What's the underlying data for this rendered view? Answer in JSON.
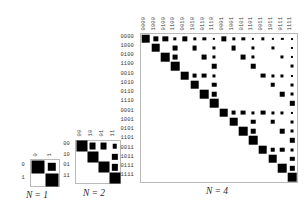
{
  "figure": {
    "background": "#ffffff",
    "marker_color": "#000000",
    "frame_color": "#b9b9b9",
    "label_color": "#3a3a3a"
  },
  "chart_data": {
    "type": "heatmap",
    "title": "",
    "xlabel": "",
    "ylabel": "",
    "grid": false,
    "legend": null,
    "panels": [
      {
        "caption": "N = 1",
        "size": 2,
        "row_labels": [
          "0",
          "1"
        ],
        "col_labels": [
          "0",
          "1"
        ],
        "markers": [
          {
            "row": 0,
            "col": 0,
            "w": 1.0
          },
          {
            "row": 0,
            "col": 1,
            "w": 0.42
          },
          {
            "row": 1,
            "col": 1,
            "w": 1.0
          }
        ]
      },
      {
        "caption": "N = 2",
        "size": 4,
        "row_labels": [
          "00",
          "10",
          "01",
          "11"
        ],
        "col_labels": [
          "00",
          "10",
          "01",
          "11"
        ],
        "markers": [
          {
            "row": 0,
            "col": 0,
            "w": 1.0
          },
          {
            "row": 0,
            "col": 1,
            "w": 0.4
          },
          {
            "row": 0,
            "col": 2,
            "w": 0.4
          },
          {
            "row": 0,
            "col": 3,
            "w": 0.17
          },
          {
            "row": 1,
            "col": 1,
            "w": 1.0
          },
          {
            "row": 1,
            "col": 3,
            "w": 0.33
          },
          {
            "row": 2,
            "col": 2,
            "w": 1.0
          },
          {
            "row": 2,
            "col": 3,
            "w": 0.33
          },
          {
            "row": 3,
            "col": 3,
            "w": 1.0
          }
        ]
      },
      {
        "caption": "N = 4",
        "size": 16,
        "row_labels": [
          "0000",
          "1000",
          "0100",
          "1100",
          "0010",
          "1010",
          "0110",
          "1110",
          "0001",
          "1001",
          "0101",
          "1101",
          "0011",
          "1011",
          "0111",
          "1111"
        ],
        "col_labels": [
          "0000",
          "1000",
          "0100",
          "1100",
          "0010",
          "1010",
          "0110",
          "1110",
          "0001",
          "1001",
          "0101",
          "1101",
          "0011",
          "1011",
          "0111",
          "1111"
        ],
        "markers": [
          {
            "row": 0,
            "col": 0,
            "w": 1.0
          },
          {
            "row": 0,
            "col": 1,
            "w": 0.38
          },
          {
            "row": 0,
            "col": 2,
            "w": 0.38
          },
          {
            "row": 0,
            "col": 3,
            "w": 0.15
          },
          {
            "row": 0,
            "col": 4,
            "w": 0.38
          },
          {
            "row": 0,
            "col": 5,
            "w": 0.15
          },
          {
            "row": 0,
            "col": 6,
            "w": 0.15
          },
          {
            "row": 0,
            "col": 7,
            "w": 0.07
          },
          {
            "row": 0,
            "col": 8,
            "w": 0.38
          },
          {
            "row": 0,
            "col": 9,
            "w": 0.15
          },
          {
            "row": 0,
            "col": 10,
            "w": 0.15
          },
          {
            "row": 0,
            "col": 11,
            "w": 0.07
          },
          {
            "row": 0,
            "col": 12,
            "w": 0.15
          },
          {
            "row": 0,
            "col": 13,
            "w": 0.07
          },
          {
            "row": 0,
            "col": 14,
            "w": 0.07
          },
          {
            "row": 0,
            "col": 15,
            "w": 0.05
          },
          {
            "row": 1,
            "col": 1,
            "w": 1.0
          },
          {
            "row": 1,
            "col": 3,
            "w": 0.32
          },
          {
            "row": 1,
            "col": 5,
            "w": 0.32
          },
          {
            "row": 1,
            "col": 7,
            "w": 0.13
          },
          {
            "row": 1,
            "col": 9,
            "w": 0.32
          },
          {
            "row": 1,
            "col": 11,
            "w": 0.13
          },
          {
            "row": 1,
            "col": 13,
            "w": 0.13
          },
          {
            "row": 1,
            "col": 15,
            "w": 0.06
          },
          {
            "row": 2,
            "col": 2,
            "w": 1.0
          },
          {
            "row": 2,
            "col": 3,
            "w": 0.32
          },
          {
            "row": 2,
            "col": 6,
            "w": 0.32
          },
          {
            "row": 2,
            "col": 7,
            "w": 0.13
          },
          {
            "row": 2,
            "col": 10,
            "w": 0.32
          },
          {
            "row": 2,
            "col": 11,
            "w": 0.13
          },
          {
            "row": 2,
            "col": 14,
            "w": 0.13
          },
          {
            "row": 2,
            "col": 15,
            "w": 0.06
          },
          {
            "row": 3,
            "col": 3,
            "w": 1.0
          },
          {
            "row": 3,
            "col": 7,
            "w": 0.28
          },
          {
            "row": 3,
            "col": 11,
            "w": 0.28
          },
          {
            "row": 3,
            "col": 15,
            "w": 0.12
          },
          {
            "row": 4,
            "col": 4,
            "w": 1.0
          },
          {
            "row": 4,
            "col": 5,
            "w": 0.32
          },
          {
            "row": 4,
            "col": 6,
            "w": 0.32
          },
          {
            "row": 4,
            "col": 7,
            "w": 0.13
          },
          {
            "row": 4,
            "col": 12,
            "w": 0.32
          },
          {
            "row": 4,
            "col": 13,
            "w": 0.13
          },
          {
            "row": 4,
            "col": 14,
            "w": 0.13
          },
          {
            "row": 4,
            "col": 15,
            "w": 0.06
          },
          {
            "row": 5,
            "col": 5,
            "w": 1.0
          },
          {
            "row": 5,
            "col": 7,
            "w": 0.28
          },
          {
            "row": 5,
            "col": 13,
            "w": 0.28
          },
          {
            "row": 5,
            "col": 15,
            "w": 0.12
          },
          {
            "row": 6,
            "col": 6,
            "w": 1.0
          },
          {
            "row": 6,
            "col": 7,
            "w": 0.28
          },
          {
            "row": 6,
            "col": 14,
            "w": 0.28
          },
          {
            "row": 6,
            "col": 15,
            "w": 0.12
          },
          {
            "row": 7,
            "col": 7,
            "w": 1.0
          },
          {
            "row": 7,
            "col": 15,
            "w": 0.26
          },
          {
            "row": 8,
            "col": 8,
            "w": 1.0
          },
          {
            "row": 8,
            "col": 9,
            "w": 0.32
          },
          {
            "row": 8,
            "col": 10,
            "w": 0.32
          },
          {
            "row": 8,
            "col": 11,
            "w": 0.13
          },
          {
            "row": 8,
            "col": 12,
            "w": 0.32
          },
          {
            "row": 8,
            "col": 13,
            "w": 0.13
          },
          {
            "row": 8,
            "col": 14,
            "w": 0.13
          },
          {
            "row": 8,
            "col": 15,
            "w": 0.06
          },
          {
            "row": 9,
            "col": 9,
            "w": 1.0
          },
          {
            "row": 9,
            "col": 11,
            "w": 0.28
          },
          {
            "row": 9,
            "col": 13,
            "w": 0.28
          },
          {
            "row": 9,
            "col": 15,
            "w": 0.12
          },
          {
            "row": 10,
            "col": 10,
            "w": 1.0
          },
          {
            "row": 10,
            "col": 11,
            "w": 0.28
          },
          {
            "row": 10,
            "col": 14,
            "w": 0.28
          },
          {
            "row": 10,
            "col": 15,
            "w": 0.12
          },
          {
            "row": 11,
            "col": 11,
            "w": 1.0
          },
          {
            "row": 11,
            "col": 15,
            "w": 0.26
          },
          {
            "row": 12,
            "col": 12,
            "w": 1.0
          },
          {
            "row": 12,
            "col": 13,
            "w": 0.28
          },
          {
            "row": 12,
            "col": 14,
            "w": 0.28
          },
          {
            "row": 12,
            "col": 15,
            "w": 0.12
          },
          {
            "row": 13,
            "col": 13,
            "w": 1.0
          },
          {
            "row": 13,
            "col": 15,
            "w": 0.26
          },
          {
            "row": 14,
            "col": 14,
            "w": 1.0
          },
          {
            "row": 14,
            "col": 15,
            "w": 0.26
          },
          {
            "row": 15,
            "col": 15,
            "w": 1.0
          }
        ]
      }
    ]
  },
  "panels": [
    {
      "caption": "N = 1"
    },
    {
      "caption": "N = 2"
    },
    {
      "caption": "N = 4"
    }
  ]
}
